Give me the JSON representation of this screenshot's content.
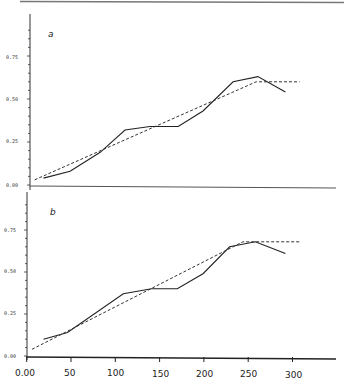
{
  "chart_data": [
    {
      "type": "line",
      "panel": "a",
      "title": "",
      "xlabel": "",
      "ylabel": "",
      "xlim": [
        0,
        340
      ],
      "ylim": [
        0,
        0.95
      ],
      "yticks": [
        "0.00",
        "0.25",
        "0.50",
        "0.75"
      ],
      "grid": false,
      "series": [
        {
          "name": "observed",
          "style": "solid",
          "x": [
            19,
            49,
            83,
            111,
            139,
            171,
            199,
            233,
            261,
            292
          ],
          "y": [
            0.04,
            0.08,
            0.19,
            0.32,
            0.34,
            0.34,
            0.43,
            0.6,
            0.63,
            0.54
          ]
        },
        {
          "name": "fitted",
          "style": "dashed",
          "x": [
            9,
            259,
            308
          ],
          "y": [
            0.03,
            0.6,
            0.6
          ]
        }
      ]
    },
    {
      "type": "line",
      "panel": "b",
      "title": "",
      "xlabel": "",
      "ylabel": "",
      "xlim": [
        0,
        340
      ],
      "ylim": [
        0,
        0.95
      ],
      "xticks": [
        "0.00",
        "50",
        "100",
        "150",
        "200",
        "250",
        "300"
      ],
      "yticks": [
        "0.00",
        "0.25",
        "0.50",
        "0.75"
      ],
      "grid": false,
      "series": [
        {
          "name": "observed",
          "style": "solid",
          "x": [
            19,
            46,
            109,
            141,
            170,
            199,
            229,
            258,
            292
          ],
          "y": [
            0.1,
            0.14,
            0.37,
            0.4,
            0.4,
            0.49,
            0.65,
            0.68,
            0.61
          ]
        },
        {
          "name": "fitted",
          "style": "dashed",
          "x": [
            6,
            244,
            308
          ],
          "y": [
            0.04,
            0.68,
            0.68
          ]
        }
      ]
    }
  ],
  "panels": {
    "a": {
      "label": "a"
    },
    "b": {
      "label": "b"
    }
  },
  "axes": {
    "y_ticks": [
      "0.00",
      "0.25",
      "0.50",
      "0.75"
    ],
    "x_ticks": [
      "0.00",
      "50",
      "100",
      "150",
      "200",
      "250",
      "300"
    ]
  }
}
